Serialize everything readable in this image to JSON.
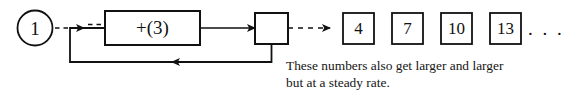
{
  "diagram": {
    "type": "feedback-loop-flow-diagram",
    "seed": {
      "label": "1",
      "shape": "circle"
    },
    "operator": {
      "label": "+(3)",
      "shape": "rectangle"
    },
    "accumulator": {
      "label": "",
      "shape": "square"
    },
    "output_sequence": {
      "values": [
        "4",
        "7",
        "10",
        "13"
      ],
      "continuation": ". . ."
    },
    "caption": "These numbers also get larger and larger\nbut at a steady rate.",
    "colors": {
      "stroke": "#111111",
      "background": "#ffffff",
      "text": "#111111"
    },
    "connectors": {
      "seed_to_operator": "dashed-arrow",
      "operator_to_accumulator": "solid-arrow",
      "accumulator_to_output": "dashed-arrow",
      "feedback": "solid-arrow-left"
    }
  }
}
